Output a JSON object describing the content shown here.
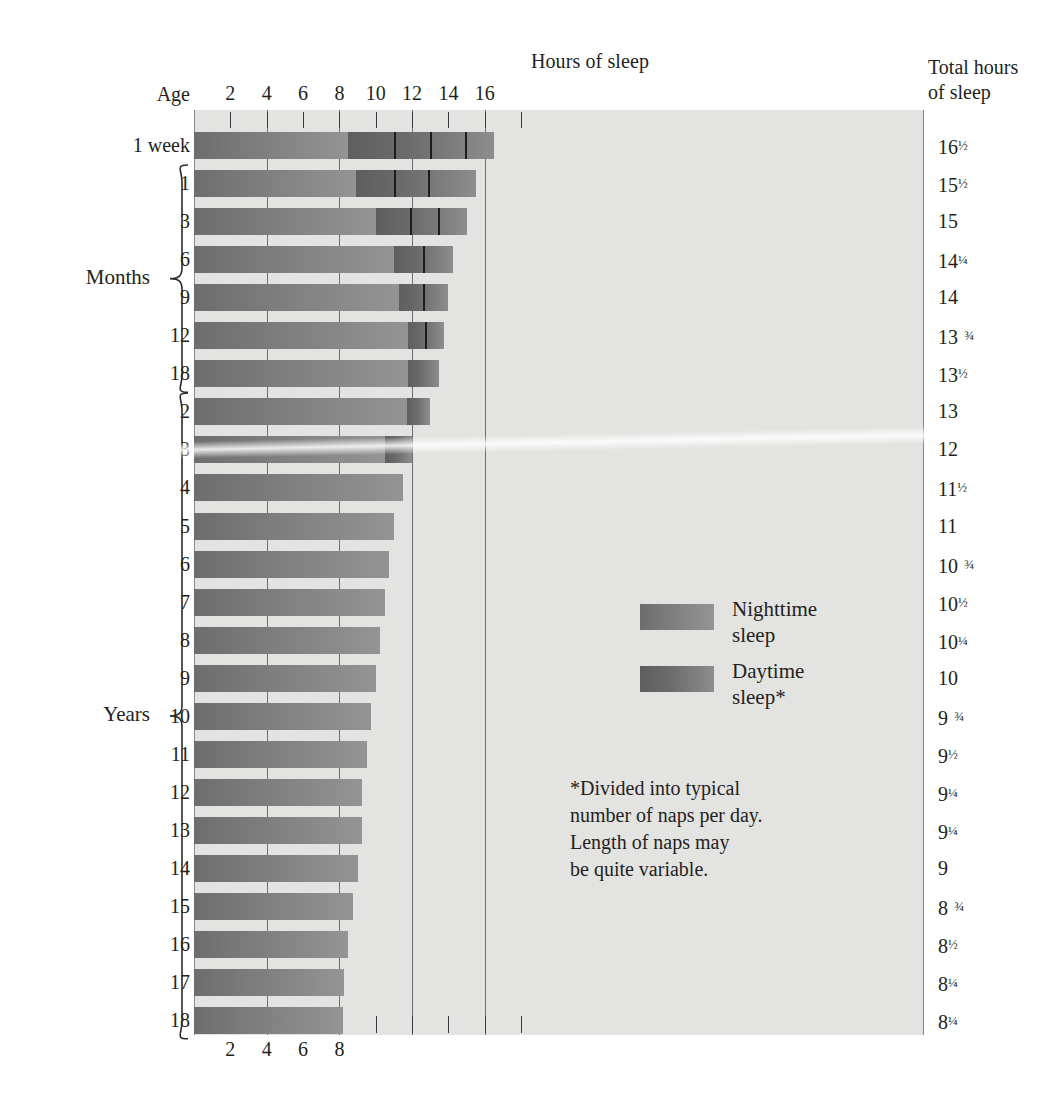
{
  "header": {
    "hours_title": "Hours of sleep",
    "age_title": "Age",
    "total_title_line1": "Total hours",
    "total_title_line2": "of sleep"
  },
  "groups": {
    "months_label": "Months",
    "years_label": "Years"
  },
  "legend": {
    "night_line1": "Nighttime",
    "night_line2": "sleep",
    "day_line1": "Daytime",
    "day_line2": "sleep*"
  },
  "footnote": {
    "line1": "*Divided into typical",
    "line2": "number of naps per day.",
    "line3": "Length of naps may",
    "line4": "be quite variable."
  },
  "colors": {
    "panel_background": "#e3e3e1",
    "night_bar": "#7b7b7b",
    "day_bar": "#6b6b6b",
    "gridline": "#6e6e6e",
    "text": "#231f20"
  },
  "chart_data": {
    "type": "bar",
    "title": "Hours of sleep",
    "xlabel": "Hours of sleep",
    "ylabel": "Age",
    "xlim": [
      0,
      18
    ],
    "grid": true,
    "legend_position": "inside-right",
    "axis_ticks_top": [
      2,
      4,
      6,
      8,
      10,
      12,
      14,
      16
    ],
    "axis_ticks_bottom": [
      2,
      4,
      6,
      8
    ],
    "gridline_hours": [
      4,
      8,
      12,
      16
    ],
    "series": [
      {
        "name": "Nighttime sleep",
        "color": "#7b7b7b"
      },
      {
        "name": "Daytime sleep*",
        "color": "#6b6b6b"
      }
    ],
    "categories": [
      "1 week",
      "1",
      "3",
      "6",
      "9",
      "12",
      "18",
      "2",
      "3",
      "4",
      "5",
      "6",
      "7",
      "8",
      "9",
      "10",
      "11",
      "12",
      "13",
      "14",
      "15",
      "16",
      "17",
      "18"
    ],
    "rows": [
      {
        "age": "1 week",
        "group": "",
        "night": 8.5,
        "day_start": 8.5,
        "day_end": 16.5,
        "naps": 4,
        "nap_dividers": [
          11.0,
          13.0,
          14.9
        ],
        "total": "16",
        "total_frac": "1/2"
      },
      {
        "age": "1",
        "group": "Months",
        "night": 8.9,
        "day_start": 8.9,
        "day_end": 15.5,
        "naps": 3,
        "nap_dividers": [
          11.0,
          12.9
        ],
        "total": "15",
        "total_frac": "1/2"
      },
      {
        "age": "3",
        "group": "Months",
        "night": 10.0,
        "day_start": 10.0,
        "day_end": 15.0,
        "naps": 3,
        "nap_dividers": [
          11.9,
          13.4
        ],
        "total": "15",
        "total_frac": ""
      },
      {
        "age": "6",
        "group": "Months",
        "night": 11.0,
        "day_start": 11.0,
        "day_end": 14.25,
        "naps": 2,
        "nap_dividers": [
          12.6
        ],
        "total": "14",
        "total_frac": "1/4"
      },
      {
        "age": "9",
        "group": "Months",
        "night": 11.3,
        "day_start": 11.3,
        "day_end": 14.0,
        "naps": 2,
        "nap_dividers": [
          12.6
        ],
        "total": "14",
        "total_frac": ""
      },
      {
        "age": "12",
        "group": "Months",
        "night": 11.8,
        "day_start": 11.8,
        "day_end": 13.75,
        "naps": 2,
        "nap_dividers": [
          12.7
        ],
        "total": "13",
        "total_frac": "3/4"
      },
      {
        "age": "18",
        "group": "Months",
        "night": 11.8,
        "day_start": 11.8,
        "day_end": 13.5,
        "naps": 1,
        "nap_dividers": [],
        "total": "13",
        "total_frac": "1/2"
      },
      {
        "age": "2",
        "group": "Years",
        "night": 11.7,
        "day_start": 11.7,
        "day_end": 13.0,
        "naps": 1,
        "nap_dividers": [],
        "total": "13",
        "total_frac": ""
      },
      {
        "age": "3",
        "group": "Years",
        "night": 10.5,
        "day_start": 10.5,
        "day_end": 12.0,
        "naps": 1,
        "nap_dividers": [],
        "total": "12",
        "total_frac": ""
      },
      {
        "age": "4",
        "group": "Years",
        "night": 11.5,
        "day_start": 0,
        "day_end": 0,
        "naps": 0,
        "nap_dividers": [],
        "total": "11",
        "total_frac": "1/2"
      },
      {
        "age": "5",
        "group": "Years",
        "night": 11.0,
        "day_start": 0,
        "day_end": 0,
        "naps": 0,
        "nap_dividers": [],
        "total": "11",
        "total_frac": ""
      },
      {
        "age": "6",
        "group": "Years",
        "night": 10.75,
        "day_start": 0,
        "day_end": 0,
        "naps": 0,
        "nap_dividers": [],
        "total": "10",
        "total_frac": "3/4"
      },
      {
        "age": "7",
        "group": "Years",
        "night": 10.5,
        "day_start": 0,
        "day_end": 0,
        "naps": 0,
        "nap_dividers": [],
        "total": "10",
        "total_frac": "1/2"
      },
      {
        "age": "8",
        "group": "Years",
        "night": 10.25,
        "day_start": 0,
        "day_end": 0,
        "naps": 0,
        "nap_dividers": [],
        "total": "10",
        "total_frac": "1/4"
      },
      {
        "age": "9",
        "group": "Years",
        "night": 10.0,
        "day_start": 0,
        "day_end": 0,
        "naps": 0,
        "nap_dividers": [],
        "total": "10",
        "total_frac": ""
      },
      {
        "age": "10",
        "group": "Years",
        "night": 9.75,
        "day_start": 0,
        "day_end": 0,
        "naps": 0,
        "nap_dividers": [],
        "total": "9",
        "total_frac": "3/4"
      },
      {
        "age": "11",
        "group": "Years",
        "night": 9.5,
        "day_start": 0,
        "day_end": 0,
        "naps": 0,
        "nap_dividers": [],
        "total": "9",
        "total_frac": "1/2"
      },
      {
        "age": "12",
        "group": "Years",
        "night": 9.25,
        "day_start": 0,
        "day_end": 0,
        "naps": 0,
        "nap_dividers": [],
        "total": "9",
        "total_frac": "1/4"
      },
      {
        "age": "13",
        "group": "Years",
        "night": 9.25,
        "day_start": 0,
        "day_end": 0,
        "naps": 0,
        "nap_dividers": [],
        "total": "9",
        "total_frac": "1/4"
      },
      {
        "age": "14",
        "group": "Years",
        "night": 9.0,
        "day_start": 0,
        "day_end": 0,
        "naps": 0,
        "nap_dividers": [],
        "total": "9",
        "total_frac": ""
      },
      {
        "age": "15",
        "group": "Years",
        "night": 8.75,
        "day_start": 0,
        "day_end": 0,
        "naps": 0,
        "nap_dividers": [],
        "total": "8",
        "total_frac": "3/4"
      },
      {
        "age": "16",
        "group": "Years",
        "night": 8.5,
        "day_start": 0,
        "day_end": 0,
        "naps": 0,
        "nap_dividers": [],
        "total": "8",
        "total_frac": "1/2"
      },
      {
        "age": "17",
        "group": "Years",
        "night": 8.25,
        "day_start": 0,
        "day_end": 0,
        "naps": 0,
        "nap_dividers": [],
        "total": "8",
        "total_frac": "1/4"
      },
      {
        "age": "18",
        "group": "Years",
        "night": 8.2,
        "day_start": 0,
        "day_end": 0,
        "naps": 0,
        "nap_dividers": [],
        "total": "8",
        "total_frac": "1/4"
      }
    ]
  }
}
